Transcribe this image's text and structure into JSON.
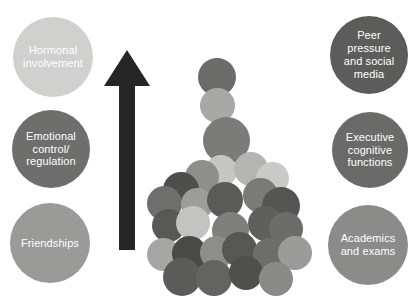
{
  "diagram": {
    "background_color": "#ffffff",
    "arrow": {
      "name": "upward-arrow",
      "color": "#262626",
      "direction": "up",
      "tip_x": 127,
      "tip_y": 50,
      "base_y": 250,
      "head_width": 46,
      "shaft_width": 16
    },
    "left_bubbles": [
      {
        "label": "Hormonal\ninvolvement",
        "color": "#d0d0cf",
        "text_color": "#ffffff",
        "x": 13,
        "y": 17,
        "size": 80,
        "font_size": 11
      },
      {
        "label": "Emotional\ncontrol/\nregulation",
        "color": "#6e6e6d",
        "text_color": "#ffffff",
        "x": 12,
        "y": 110,
        "size": 78,
        "font_size": 11
      },
      {
        "label": "Friendships",
        "color": "#9a9a99",
        "text_color": "#ffffff",
        "x": 10,
        "y": 203,
        "size": 80,
        "font_size": 11
      }
    ],
    "right_bubbles": [
      {
        "label": "Peer pressure\nand social\nmedia",
        "color": "#5c5c5b",
        "text_color": "#ffffff",
        "x": 330,
        "y": 16,
        "size": 78,
        "font_size": 11
      },
      {
        "label": "Executive\ncognitive\nfunctions",
        "color": "#6a6a69",
        "text_color": "#ffffff",
        "x": 332,
        "y": 112,
        "size": 76,
        "font_size": 11
      },
      {
        "label": "Academics\nand exams",
        "color": "#8b8b8a",
        "text_color": "#ffffff",
        "x": 328,
        "y": 205,
        "size": 80,
        "font_size": 11
      }
    ],
    "cluster": {
      "name": "central-circle-cluster",
      "dots": [
        {
          "x": 198,
          "y": 58,
          "size": 38,
          "color": "#6b6b6a"
        },
        {
          "x": 200,
          "y": 88,
          "size": 35,
          "color": "#a8a8a7"
        },
        {
          "x": 203,
          "y": 117,
          "size": 47,
          "color": "#7b7b7a"
        },
        {
          "x": 205,
          "y": 155,
          "size": 32,
          "color": "#c6c6c5"
        },
        {
          "x": 234,
          "y": 152,
          "size": 34,
          "color": "#b4b4b3"
        },
        {
          "x": 256,
          "y": 162,
          "size": 33,
          "color": "#c9c9c8"
        },
        {
          "x": 185,
          "y": 160,
          "size": 34,
          "color": "#8e8e8d"
        },
        {
          "x": 163,
          "y": 172,
          "size": 36,
          "color": "#4e4e4d"
        },
        {
          "x": 147,
          "y": 186,
          "size": 35,
          "color": "#6f6f6e"
        },
        {
          "x": 181,
          "y": 188,
          "size": 32,
          "color": "#9d9d9c"
        },
        {
          "x": 207,
          "y": 182,
          "size": 36,
          "color": "#5a5a59"
        },
        {
          "x": 243,
          "y": 178,
          "size": 35,
          "color": "#7a7a79"
        },
        {
          "x": 262,
          "y": 187,
          "size": 38,
          "color": "#555554"
        },
        {
          "x": 152,
          "y": 209,
          "size": 33,
          "color": "#585857"
        },
        {
          "x": 176,
          "y": 206,
          "size": 34,
          "color": "#c3c3c2"
        },
        {
          "x": 212,
          "y": 212,
          "size": 37,
          "color": "#7f7f7e"
        },
        {
          "x": 248,
          "y": 206,
          "size": 35,
          "color": "#5f5f5e"
        },
        {
          "x": 269,
          "y": 212,
          "size": 34,
          "color": "#6c6c6b"
        },
        {
          "x": 147,
          "y": 238,
          "size": 33,
          "color": "#a6a6a5"
        },
        {
          "x": 172,
          "y": 236,
          "size": 35,
          "color": "#4a4a49"
        },
        {
          "x": 200,
          "y": 236,
          "size": 33,
          "color": "#8d8d8c"
        },
        {
          "x": 222,
          "y": 232,
          "size": 35,
          "color": "#565655"
        },
        {
          "x": 253,
          "y": 238,
          "size": 33,
          "color": "#6d6d6c"
        },
        {
          "x": 278,
          "y": 236,
          "size": 34,
          "color": "#9b9b9a"
        },
        {
          "x": 163,
          "y": 258,
          "size": 38,
          "color": "#5b5b5a"
        },
        {
          "x": 196,
          "y": 260,
          "size": 36,
          "color": "#636362"
        },
        {
          "x": 229,
          "y": 256,
          "size": 34,
          "color": "#4f4f4e"
        },
        {
          "x": 259,
          "y": 262,
          "size": 34,
          "color": "#8a8a89"
        }
      ]
    }
  }
}
